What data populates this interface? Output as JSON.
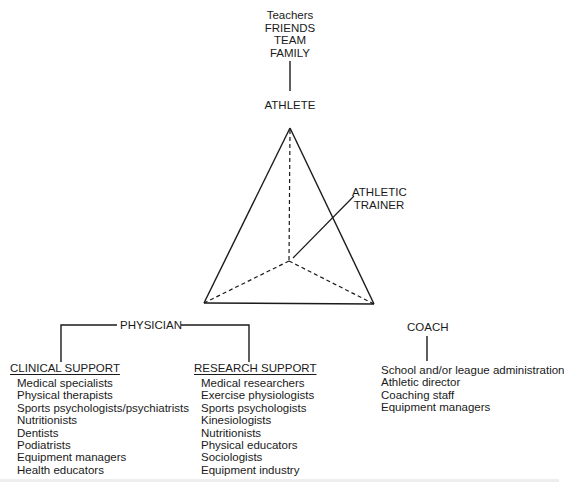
{
  "top_group": [
    "Teachers",
    "FRIENDS",
    "TEAM",
    "FAMILY"
  ],
  "nodes": {
    "athlete": "ATHLETE",
    "athletic_trainer": [
      "ATHLETIC",
      "TRAINER"
    ],
    "physician": "PHYSICIAN",
    "coach": "COACH"
  },
  "clinical_support": {
    "heading": "CLINICAL SUPPORT",
    "items": [
      "Medical specialists",
      "Physical therapists",
      "Sports psychologists/psychiatrists",
      "Nutritionists",
      "Dentists",
      "Podiatrists",
      "Equipment managers",
      "Health educators"
    ]
  },
  "research_support": {
    "heading": "RESEARCH SUPPORT",
    "items": [
      "Medical researchers",
      "Exercise physiologists",
      "Sports psychologists",
      "Kinesiologists",
      "Nutritionists",
      "Physical educators",
      "Sociologists",
      "Equipment industry"
    ]
  },
  "coach_support": {
    "items": [
      "School and/or league administration",
      "Athletic director",
      "Coaching staff",
      "Equipment managers"
    ]
  }
}
